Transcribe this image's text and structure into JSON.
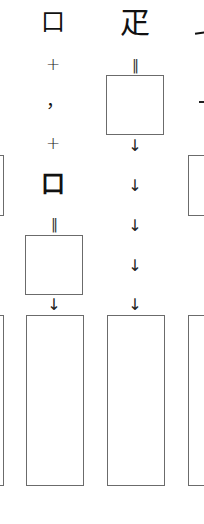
{
  "diagram": {
    "type": "character-decomposition",
    "colors": {
      "box_border": "#6b6b6b",
      "ink": "#111111",
      "background": "#ffffff"
    },
    "columns": [
      {
        "id": "col-left-partial",
        "boxes": [
          "small-box",
          "tall-box"
        ]
      },
      {
        "id": "col-1",
        "top_glyph": "口",
        "components": [
          {
            "kind": "operator",
            "text": "+"
          },
          {
            "kind": "stroke",
            "text": "，"
          },
          {
            "kind": "operator",
            "text": "+"
          },
          {
            "kind": "component",
            "text": "口"
          }
        ],
        "equals": "‖",
        "arrow": "↓"
      },
      {
        "id": "col-2",
        "top_glyph": "疋",
        "equals": "‖",
        "arrows": [
          "↓",
          "↓",
          "↓",
          "↓",
          "↓"
        ]
      },
      {
        "id": "col-3-partial",
        "top_glyph_partial": "一",
        "stroke_partial": "-"
      }
    ]
  }
}
